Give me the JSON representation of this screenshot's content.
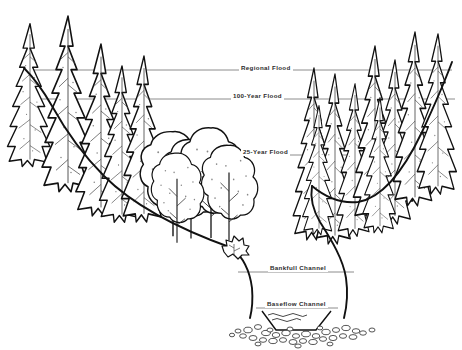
{
  "diagram": {
    "style": "pen-and-ink line drawing",
    "background_color": "#ffffff",
    "ink_color": "#1a1a1a",
    "stage_line_color": "#8c8c8c",
    "canvas": {
      "width": 462,
      "height": 350
    }
  },
  "stage_lines": [
    {
      "id": "regional-flood",
      "label": "Regional Flood",
      "y": 70,
      "x_start": 26,
      "x_end": 452,
      "label_x": 239,
      "label_y": 64,
      "rank": 1,
      "description": "highest flood elevation shown, spans the entire valley"
    },
    {
      "id": "100-year-flood",
      "label": "100-Year Flood",
      "y": 99,
      "x_start": 36,
      "x_end": 455,
      "label_x": 231,
      "label_y": 92,
      "rank": 2,
      "description": "second highest flood elevation"
    },
    {
      "id": "25-year-flood",
      "label": "25-Year Flood",
      "y": 155,
      "x_start": 84,
      "x_end": 447,
      "label_x": 241,
      "label_y": 148,
      "rank": 3,
      "description": "flood elevation reaching the floodplain terrace"
    },
    {
      "id": "bankfull-channel",
      "label": "Bankfull Channel",
      "y": 272,
      "x_start": 238,
      "x_end": 354,
      "label_x": 268,
      "label_y": 264,
      "rank": 4,
      "description": "top-of-bank water surface in the incised channel"
    },
    {
      "id": "baseflow-channel",
      "label": "Baseflow Channel",
      "y": 308,
      "x_start": 256,
      "x_end": 338,
      "label_x": 265,
      "label_y": 300,
      "rank": 5,
      "description": "low-flow water surface at the channel bottom"
    }
  ],
  "terrain": {
    "left_slope": "gentle descending hillslope from upper-left toward the floodplain",
    "floodplain": "broad flat terrace in the center occupied by deciduous trees",
    "channel": "narrow incised V / U-shaped channel at center-right of the valley floor",
    "right_slope": "steep ascending hillslope on the right side",
    "bed_material": "cobble and gravel deposits across the channel bed"
  },
  "vegetation": {
    "left_hillslope": {
      "type": "conifer",
      "count": 5,
      "note": "tall spire-shaped evergreens stepping down the left slope"
    },
    "floodplain": {
      "type": "deciduous",
      "count": 5,
      "note": "rounded-crown broadleaf trees with slender trunks on the terrace"
    },
    "right_hillslope": {
      "type": "conifer",
      "count": 9,
      "note": "dense stand of evergreens climbing the right slope"
    },
    "bank_shrub": {
      "type": "shrub",
      "count": 1,
      "note": "small shrub on the left bank edge above the channel"
    }
  }
}
